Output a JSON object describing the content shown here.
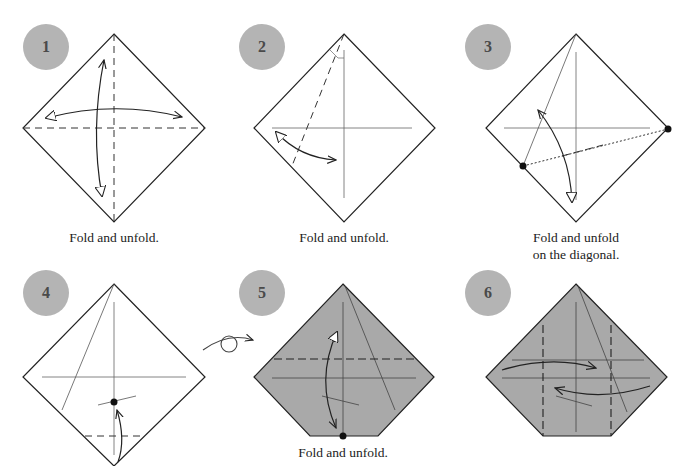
{
  "colors": {
    "badge": "#b4b4b4",
    "paper_back": "#a9a9a9",
    "line": "#222222"
  },
  "steps": [
    {
      "number": "1",
      "caption": "Fold and unfold."
    },
    {
      "number": "2",
      "caption": "Fold and unfold."
    },
    {
      "number": "3",
      "caption": "Fold and unfold\non the diagonal."
    },
    {
      "number": "4",
      "caption": ""
    },
    {
      "number": "5",
      "caption": "Fold and unfold."
    },
    {
      "number": "6",
      "caption": ""
    }
  ],
  "symbols": {
    "turn_over": "turn-over-icon"
  }
}
